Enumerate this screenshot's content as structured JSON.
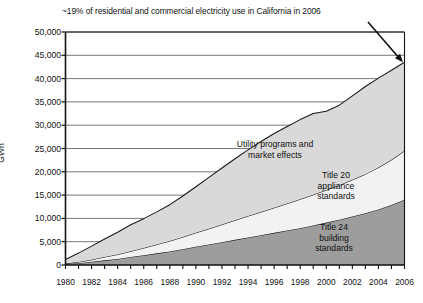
{
  "annotation": {
    "text": "~19% of residential and commercial electricity use in California in 2006",
    "arrow_points_to_year": 2006,
    "arrow_points_to_value": 43500
  },
  "axis": {
    "y_label": "GWh",
    "y_ticks": [
      "50,000",
      "45,000",
      "40,000",
      "35,000",
      "30,000",
      "25,000",
      "20,000",
      "15,000",
      "10,000",
      "5,000",
      "0"
    ],
    "x_ticks": [
      "1980",
      "1982",
      "1984",
      "1986",
      "1988",
      "1990",
      "1992",
      "1994",
      "1996",
      "1998",
      "2000",
      "2002",
      "2004",
      "2006"
    ]
  },
  "band_labels": {
    "utility_line1": "Utility programs and",
    "utility_line2": "market effects",
    "title20_line1": "Title 20",
    "title20_line2": "appliance",
    "title20_line3": "standards",
    "title24_line1": "Title 24",
    "title24_line2": "building",
    "title24_line3": "standards"
  },
  "colors": {
    "title24_fill": "#9d9d9d",
    "title20_fill": "#f2f2f2",
    "utility_fill": "#d9d9d9",
    "gridline": "#555555",
    "axis": "#111111",
    "series_outline": "#1a1a1a",
    "background": "#ffffff"
  },
  "chart_data": {
    "type": "area",
    "title": "",
    "subtitle": "",
    "xlabel": "",
    "ylabel": "GWh",
    "xlim": [
      1980,
      2006
    ],
    "ylim": [
      0,
      50000
    ],
    "grid": true,
    "stacked": true,
    "legend_position": "inline-labels",
    "x": [
      1980,
      1981,
      1982,
      1983,
      1984,
      1985,
      1986,
      1987,
      1988,
      1989,
      1990,
      1991,
      1992,
      1993,
      1994,
      1995,
      1996,
      1997,
      1998,
      1999,
      2000,
      2001,
      2002,
      2003,
      2004,
      2005,
      2006
    ],
    "series": [
      {
        "name": "Title 24 building standards",
        "color": "#9d9d9d",
        "values": [
          200,
          400,
          700,
          1000,
          1300,
          1700,
          2100,
          2500,
          2900,
          3400,
          3900,
          4400,
          4900,
          5400,
          5900,
          6400,
          6900,
          7400,
          7900,
          8500,
          9100,
          9700,
          10400,
          11100,
          11900,
          12900,
          14000
        ]
      },
      {
        "name": "Title 20 appliance standards",
        "color": "#f2f2f2",
        "values": [
          100,
          250,
          450,
          700,
          950,
          1250,
          1550,
          1900,
          2250,
          2600,
          3000,
          3400,
          3800,
          4200,
          4600,
          5000,
          5400,
          5800,
          6200,
          6600,
          7000,
          7400,
          7900,
          8400,
          9000,
          9700,
          10500
        ]
      },
      {
        "name": "Utility programs and market effects",
        "color": "#d9d9d9",
        "values": [
          900,
          1900,
          2900,
          3900,
          4800,
          5700,
          6300,
          7000,
          7800,
          8800,
          9900,
          11000,
          12100,
          13200,
          14200,
          15100,
          15900,
          16500,
          17100,
          17400,
          16900,
          17200,
          18000,
          18800,
          19200,
          19200,
          19000
        ]
      }
    ],
    "stack_top_total": [
      1200,
      2550,
      4050,
      5600,
      7050,
      8650,
      9950,
      11400,
      12950,
      14800,
      16800,
      18800,
      20800,
      22800,
      24700,
      26500,
      28200,
      29700,
      31200,
      32500,
      33000,
      34300,
      36300,
      38300,
      40100,
      41800,
      43500
    ],
    "annotations": [
      {
        "text": "~19% of residential and commercial electricity use in California in 2006",
        "x": 2006,
        "y": 43500
      }
    ]
  }
}
